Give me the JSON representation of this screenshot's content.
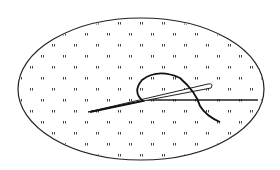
{
  "diagram": {
    "fabric": {
      "shape": "ellipse",
      "cx": 141,
      "cy": 89,
      "rx": 123,
      "ry": 71,
      "stroke": "#222222"
    },
    "grid": {
      "rows": [
        22,
        33,
        44,
        55,
        66,
        77,
        88,
        99,
        110,
        121,
        132,
        143,
        154
      ],
      "mark_color": "#444444"
    },
    "needle": {
      "color": "#222222"
    },
    "thread": {
      "color": "#1a1a1a"
    }
  }
}
